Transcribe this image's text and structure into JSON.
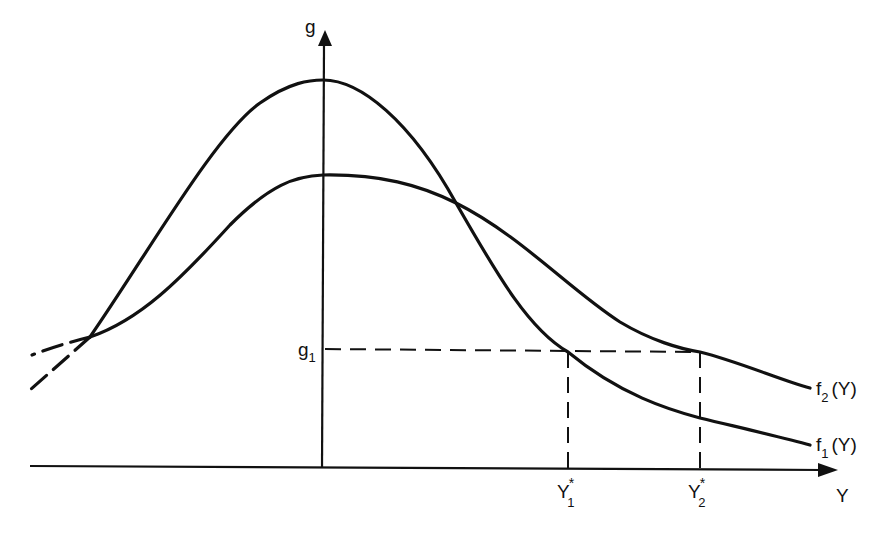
{
  "diagram": {
    "type": "function-curves",
    "colors": {
      "ink": "#111111",
      "background": "#ffffff"
    },
    "axes": {
      "vertical": {
        "label": "g"
      },
      "horizontal": {
        "label": "Y"
      }
    },
    "level": {
      "label": "g",
      "subscript": "1"
    },
    "curves": [
      {
        "id": "f1",
        "name": "f",
        "subscript": "1",
        "arg": "(Y)",
        "shape": "tall, narrow peak"
      },
      {
        "id": "f2",
        "name": "f",
        "subscript": "2",
        "arg": "(Y)",
        "shape": "lower, wider peak"
      }
    ],
    "markers": [
      {
        "label": "Y",
        "superscript": "*",
        "subscript": "1"
      },
      {
        "label": "Y",
        "superscript": "*",
        "subscript": "2"
      }
    ]
  }
}
